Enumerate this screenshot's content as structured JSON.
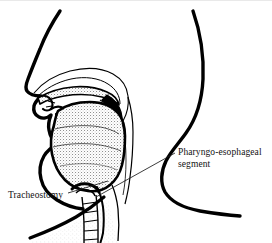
{
  "figure": {
    "background_color": "#ffffff",
    "ink_color": "#000000",
    "stipple_color": "#8a8a8a",
    "width": 272,
    "height": 243
  },
  "labels": [
    {
      "id": "pharyngo-esophageal-segment",
      "text": "Pharyngo-esophageal segment",
      "line1": "Pharyngo-esophageal",
      "line2": "segment",
      "x": 178,
      "y": 146
    },
    {
      "id": "tracheostomy",
      "text": "Tracheostomy",
      "x": 8,
      "y": 189
    }
  ],
  "leader_lines": [
    {
      "id": "leader-pharyngo",
      "from_x": 175,
      "from_y": 152,
      "to_x": 96,
      "to_y": 196
    },
    {
      "id": "leader-tracheostomy",
      "from_x": 68,
      "from_y": 192,
      "to_x": 108,
      "to_y": 180
    }
  ],
  "anatomy_parts": [
    {
      "id": "facial-profile",
      "name": "Facial profile: forehead, nose, lips, chin"
    },
    {
      "id": "nasal-cavity",
      "name": "Nasal cavity"
    },
    {
      "id": "hard-palate",
      "name": "Hard palate"
    },
    {
      "id": "soft-palate",
      "name": "Soft palate"
    },
    {
      "id": "tongue",
      "name": "Tongue"
    },
    {
      "id": "oral-cavity",
      "name": "Oral cavity"
    },
    {
      "id": "pharyngeal-wall",
      "name": "Posterior pharyngeal wall"
    },
    {
      "id": "pharyngo-esophageal-segment",
      "name": "Pharyngo-esophageal segment"
    },
    {
      "id": "trachea",
      "name": "Trachea with cartilage rings"
    },
    {
      "id": "tracheostoma",
      "name": "Tracheostoma"
    },
    {
      "id": "posterior-head-neck-contour",
      "name": "Posterior head, neck and shoulder contour"
    },
    {
      "id": "chest-contour",
      "name": "Anterior chest contour"
    }
  ]
}
